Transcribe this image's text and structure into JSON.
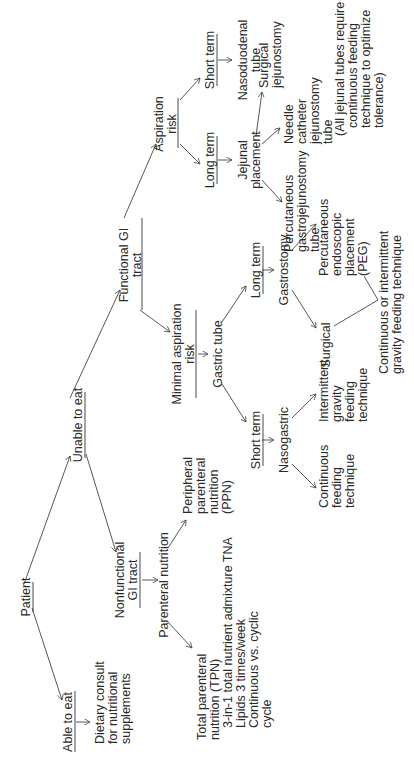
{
  "diagram": {
    "nodes": {
      "patient": {
        "label": "Patient"
      },
      "able_to_eat": {
        "label": "Able to eat"
      },
      "dietary_consult": {
        "lines": [
          "Dietary consult",
          "for nutritional",
          "supplements"
        ]
      },
      "unable_to_eat": {
        "label": "Unable to eat"
      },
      "nonfunctional_gi": {
        "lines": [
          "Nonfunctional",
          "GI tract"
        ]
      },
      "parenteral_nutrition": {
        "label": "Parenteral nutrition"
      },
      "tpn": {
        "lines": [
          "Total parenteral",
          "nutrition (TPN)",
          "3-in-1 total nutrient admixture TNA",
          "Lipids 3 times/week",
          "Continuous vs. cyclic",
          "cycle"
        ]
      },
      "ppn": {
        "lines": [
          "Peripheral",
          "parenteral",
          "nutrition",
          "(PPN)"
        ]
      },
      "functional_gi": {
        "lines": [
          "Functional GI",
          "tract"
        ]
      },
      "minimal_aspiration_risk": {
        "lines": [
          "Minimal aspiration",
          "risk"
        ]
      },
      "gastric_tube": {
        "label": "Gastric tube"
      },
      "gastric_short_term": {
        "label": "Short term"
      },
      "gastric_long_term": {
        "label": "Long term"
      },
      "nasogastric": {
        "label": "Nasogastric"
      },
      "continuous_feeding": {
        "lines": [
          "Continuous",
          "feeding",
          "technique"
        ]
      },
      "intermittent_gravity": {
        "lines": [
          "Intermittent",
          "gravity",
          "feeding",
          "technique"
        ]
      },
      "gastrostomy": {
        "label": "Gastrostomy"
      },
      "surgical_gastrostomy": {
        "label": "Surgical"
      },
      "peg": {
        "lines": [
          "Percutaneous",
          "endoscopic",
          "placement",
          "(PEG)"
        ]
      },
      "gastrostomy_feeding": {
        "lines": [
          "Continuous or intermittent",
          "gravity feeding technique"
        ]
      },
      "aspiration_risk": {
        "lines": [
          "Aspiration",
          "risk"
        ]
      },
      "jejunal_long_term": {
        "label": "Long term"
      },
      "duodenal_short_term": {
        "label": "Short term"
      },
      "nasoduodenal": {
        "lines": [
          "Nasoduodenal",
          "tube"
        ]
      },
      "jejunal_placement": {
        "lines": [
          "Jejunal",
          "placement"
        ]
      },
      "pgj_tube": {
        "lines": [
          "Percutaneous",
          "gastrojejunostomy",
          "tube"
        ]
      },
      "needle_catheter": {
        "lines": [
          "Needle",
          "catheter",
          "jejunostomy",
          "tube"
        ]
      },
      "surgical_jejunostomy": {
        "lines": [
          "Surgical",
          "jejunostomy"
        ]
      },
      "jejunal_note": {
        "lines": [
          "(All jejunal tubes require",
          "continuous feeding",
          "technique to optimize",
          "tolerance)"
        ]
      }
    },
    "colors": {
      "text": "#2a2a2a",
      "lines": "#444444",
      "background": "#ffffff"
    }
  }
}
